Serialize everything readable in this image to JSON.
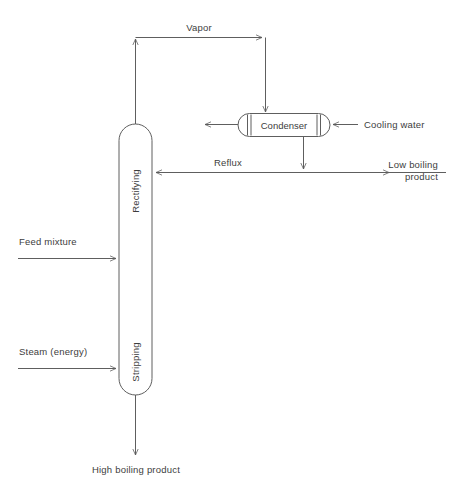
{
  "diagram": {
    "colors": {
      "line": "#5e5e5e",
      "text": "#3d3d3d",
      "background": "#ffffff",
      "vessel_fill": "#ffffff"
    },
    "column": {
      "upper_section_label": "Rectifying",
      "lower_section_label": "Stripping"
    },
    "equipment": {
      "condenser_label": "Condenser"
    },
    "streams": {
      "vapor": "Vapor",
      "cooling_water": "Cooling water",
      "reflux": "Reflux",
      "low_boiling_product_line1": "Low boiling",
      "low_boiling_product_line2": "product",
      "feed_mixture": "Feed mixture",
      "steam_energy": "Steam (energy)",
      "high_boiling_product": "High boiling product"
    }
  }
}
